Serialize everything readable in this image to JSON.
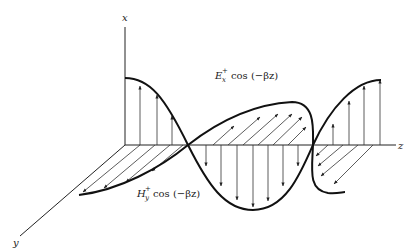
{
  "figure": {
    "type": "electromagnetic plane wave",
    "axes": {
      "x_label": "x",
      "y_label": "y",
      "z_label": "z"
    },
    "labels": {
      "e_field": {
        "symbol": "E",
        "superscript": "+",
        "subscript": "x",
        "expr": "cos (−βz)"
      },
      "h_field": {
        "symbol": "H",
        "superscript": "+",
        "subscript": "y",
        "expr": "cos (−βz)"
      }
    },
    "colors": {
      "ink": "#222222",
      "background": "#ffffff"
    }
  }
}
